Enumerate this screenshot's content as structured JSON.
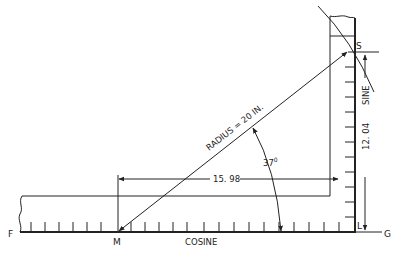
{
  "diagram": {
    "points": {
      "F": "F",
      "M": "M",
      "S": "S",
      "L": "L",
      "G": "G"
    },
    "labels": {
      "radius": "RADIUS = 20 IN.",
      "angle": "37°",
      "angle_base": "37",
      "angle_deg": "0",
      "cosine_value": "15. 98",
      "sine_value": "12. 04",
      "cosine": "COSINE",
      "sine": "SINE"
    },
    "colors": {
      "ink": "#222222",
      "background": "#ffffff"
    }
  }
}
